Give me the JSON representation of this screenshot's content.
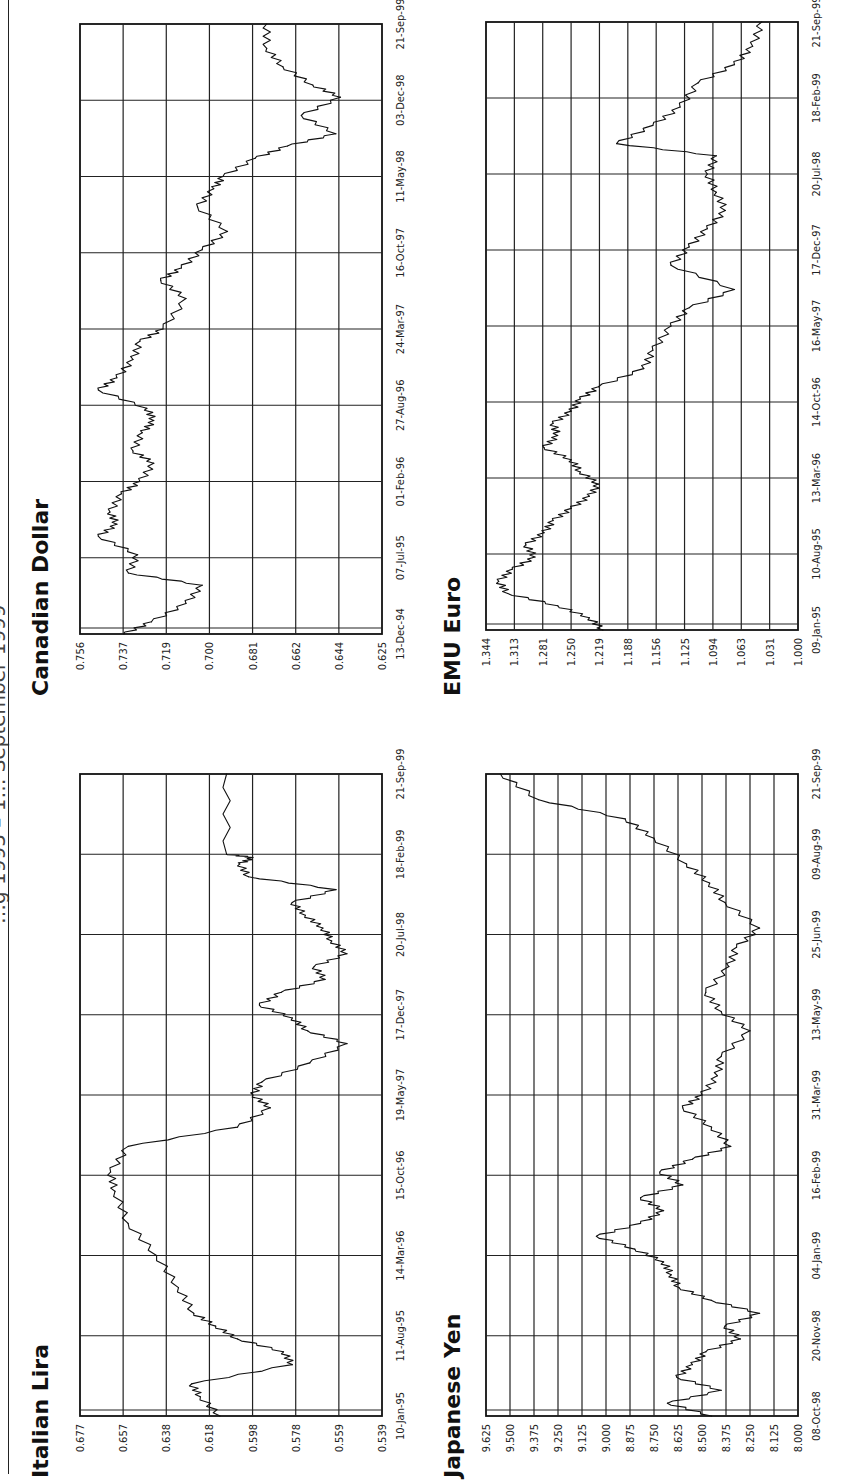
{
  "header": {
    "text": "…g 1995 – 1… September 1999"
  },
  "chart_data": [
    {
      "id": "italian-lira",
      "type": "line",
      "title": "Italian Lira",
      "xlabel": "",
      "ylabel": "",
      "ylim": [
        0.539,
        0.677
      ],
      "yticks": [
        "0.677",
        "0.657",
        "0.638",
        "0.618",
        "0.598",
        "0.578",
        "0.559",
        "0.539"
      ],
      "xticks": [
        "10-Jan-95",
        "11-Aug-95",
        "14-Mar-96",
        "15-Oct-96",
        "19-May-97",
        "17-Dec-97",
        "20-Jul-98",
        "18-Feb-99",
        "21-Sep-99"
      ],
      "grid": true,
      "x": [
        0,
        0.03,
        0.05,
        0.08,
        0.1,
        0.12,
        0.14,
        0.16,
        0.2,
        0.25,
        0.3,
        0.35,
        0.38,
        0.42,
        0.45,
        0.48,
        0.5,
        0.52,
        0.55,
        0.58,
        0.6,
        0.62,
        0.64,
        0.66,
        0.68,
        0.7,
        0.72,
        0.74,
        0.76,
        0.78,
        0.8,
        0.82,
        0.84,
        0.86,
        0.87,
        0.875,
        1.0
      ],
      "values": [
        0.613,
        0.622,
        0.626,
        0.58,
        0.584,
        0.605,
        0.615,
        0.625,
        0.632,
        0.642,
        0.655,
        0.661,
        0.663,
        0.655,
        0.605,
        0.59,
        0.598,
        0.594,
        0.572,
        0.555,
        0.573,
        0.58,
        0.595,
        0.585,
        0.565,
        0.57,
        0.555,
        0.562,
        0.566,
        0.574,
        0.58,
        0.56,
        0.6,
        0.604,
        0.598,
        0.61,
        0.61
      ]
    },
    {
      "id": "canadian-dollar",
      "type": "line",
      "title": "Canadian Dollar",
      "xlabel": "",
      "ylabel": "",
      "ylim": [
        0.625,
        0.756
      ],
      "yticks": [
        "0.756",
        "0.737",
        "0.719",
        "0.700",
        "0.681",
        "0.662",
        "0.644",
        "0.625"
      ],
      "xticks": [
        "13-Dec-94",
        "07-Jul-95",
        "01-Feb-96",
        "27-Aug-96",
        "24-Mar-97",
        "16-Oct-97",
        "11-May-98",
        "03-Dec-98",
        "21-Sep-99"
      ],
      "grid": true,
      "x": [
        0,
        0.02,
        0.05,
        0.08,
        0.1,
        0.13,
        0.16,
        0.18,
        0.2,
        0.23,
        0.25,
        0.28,
        0.3,
        0.33,
        0.35,
        0.37,
        0.4,
        0.42,
        0.45,
        0.48,
        0.5,
        0.55,
        0.58,
        0.6,
        0.63,
        0.66,
        0.7,
        0.73,
        0.75,
        0.78,
        0.8,
        0.82,
        0.85,
        0.88,
        0.9,
        0.93,
        0.96,
        1.0
      ],
      "values": [
        0.737,
        0.725,
        0.71,
        0.703,
        0.735,
        0.731,
        0.748,
        0.74,
        0.743,
        0.738,
        0.73,
        0.724,
        0.733,
        0.729,
        0.724,
        0.727,
        0.748,
        0.74,
        0.733,
        0.73,
        0.72,
        0.71,
        0.721,
        0.712,
        0.703,
        0.692,
        0.705,
        0.698,
        0.694,
        0.68,
        0.666,
        0.645,
        0.66,
        0.643,
        0.655,
        0.668,
        0.675,
        0.675
      ]
    },
    {
      "id": "japanese-yen",
      "type": "line",
      "title": "Japanese Yen",
      "xlabel": "",
      "ylabel": "",
      "ylim": [
        8.0,
        9.625
      ],
      "yticks": [
        "9.625",
        "9.500",
        "9.375",
        "9.250",
        "9.125",
        "9.000",
        "8.875",
        "8.750",
        "8.625",
        "8.500",
        "8.375",
        "8.250",
        "8.125",
        "8.000"
      ],
      "xticks": [
        "08-Oct-98",
        "20-Nov-98",
        "04-Jan-99",
        "16-Feb-99",
        "31-Mar-99",
        "13-May-99",
        "25-Jun-99",
        "09-Aug-99",
        "21-Sep-99"
      ],
      "grid": true,
      "x": [
        0,
        0.02,
        0.04,
        0.06,
        0.08,
        0.1,
        0.12,
        0.14,
        0.16,
        0.18,
        0.2,
        0.22,
        0.24,
        0.26,
        0.28,
        0.3,
        0.32,
        0.34,
        0.36,
        0.38,
        0.4,
        0.42,
        0.45,
        0.48,
        0.5,
        0.53,
        0.56,
        0.6,
        0.63,
        0.66,
        0.7,
        0.73,
        0.76,
        0.8,
        0.83,
        0.86,
        0.9,
        0.93,
        0.96,
        1.0
      ],
      "values": [
        8.45,
        8.68,
        8.4,
        8.63,
        8.55,
        8.48,
        8.3,
        8.38,
        8.2,
        8.45,
        8.62,
        8.66,
        8.7,
        8.85,
        9.05,
        8.82,
        8.7,
        8.82,
        8.6,
        8.72,
        8.55,
        8.35,
        8.45,
        8.6,
        8.5,
        8.42,
        8.4,
        8.25,
        8.4,
        8.48,
        8.36,
        8.32,
        8.2,
        8.38,
        8.46,
        8.58,
        8.75,
        8.9,
        9.35,
        9.55
      ]
    },
    {
      "id": "emu-euro",
      "type": "line",
      "title": "EMU Euro",
      "xlabel": "",
      "ylabel": "",
      "ylim": [
        1.0,
        1.344
      ],
      "yticks": [
        "1.344",
        "1.313",
        "1.281",
        "1.250",
        "1.219",
        "1.188",
        "1.156",
        "1.125",
        "1.094",
        "1.063",
        "1.031",
        "1.000"
      ],
      "xticks": [
        "09-Jan-95",
        "10-Aug-95",
        "13-Mar-96",
        "14-Oct-96",
        "16-May-97",
        "17-Dec-97",
        "20-Jul-98",
        "18-Feb-99",
        "21-Sep-99"
      ],
      "grid": true,
      "x": [
        0,
        0.02,
        0.04,
        0.06,
        0.08,
        0.1,
        0.12,
        0.14,
        0.16,
        0.18,
        0.2,
        0.22,
        0.24,
        0.26,
        0.28,
        0.3,
        0.32,
        0.34,
        0.36,
        0.38,
        0.4,
        0.43,
        0.46,
        0.5,
        0.53,
        0.56,
        0.6,
        0.63,
        0.66,
        0.69,
        0.72,
        0.75,
        0.78,
        0.8,
        0.83,
        0.86,
        0.9,
        0.93,
        0.96,
        1.0
      ],
      "values": [
        1.215,
        1.23,
        1.265,
        1.32,
        1.33,
        1.315,
        1.29,
        1.3,
        1.28,
        1.27,
        1.25,
        1.23,
        1.22,
        1.24,
        1.25,
        1.28,
        1.265,
        1.27,
        1.25,
        1.24,
        1.22,
        1.17,
        1.16,
        1.14,
        1.12,
        1.07,
        1.14,
        1.12,
        1.1,
        1.08,
        1.09,
        1.1,
        1.09,
        1.2,
        1.16,
        1.13,
        1.11,
        1.07,
        1.05,
        1.04
      ]
    }
  ]
}
